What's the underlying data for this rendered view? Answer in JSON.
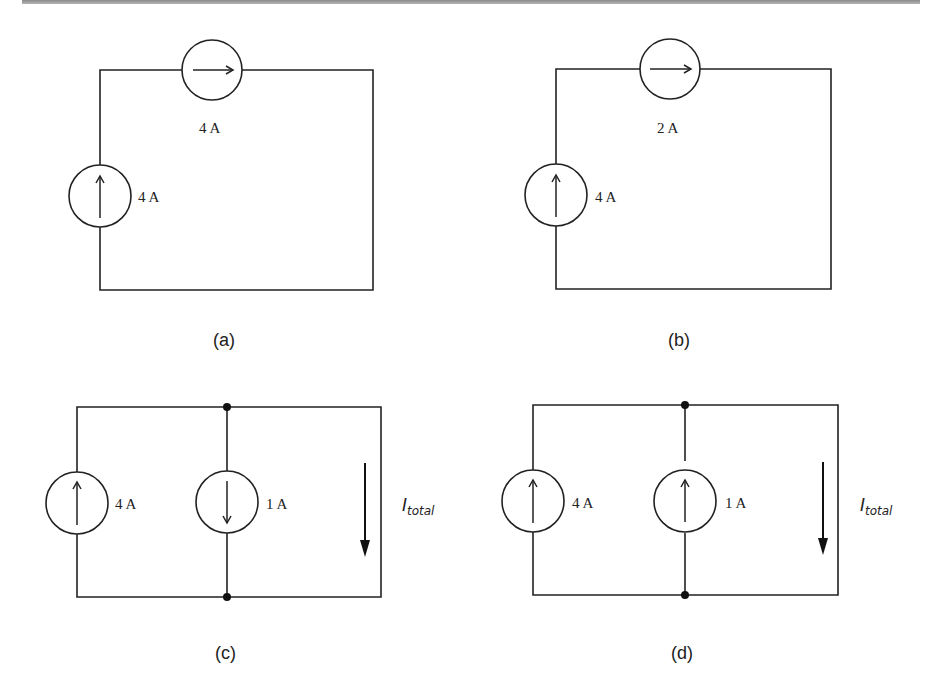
{
  "figure": {
    "header_rule_color": "#9a9a9a",
    "circuits": [
      {
        "id": "a",
        "caption": "(a)",
        "topology": "series loop",
        "sources": [
          {
            "position": "top",
            "direction": "right",
            "label": "4 A"
          },
          {
            "position": "left",
            "direction": "up",
            "label": "4 A"
          }
        ]
      },
      {
        "id": "b",
        "caption": "(b)",
        "topology": "series loop",
        "sources": [
          {
            "position": "top",
            "direction": "right",
            "label": "2 A"
          },
          {
            "position": "left",
            "direction": "up",
            "label": "4 A"
          }
        ]
      },
      {
        "id": "c",
        "caption": "(c)",
        "topology": "parallel",
        "sources": [
          {
            "position": "left",
            "direction": "up",
            "label": "4 A"
          },
          {
            "position": "middle",
            "direction": "down",
            "label": "1 A"
          }
        ],
        "current_label": {
          "main": "I",
          "sub": "total",
          "direction": "down"
        }
      },
      {
        "id": "d",
        "caption": "(d)",
        "topology": "parallel",
        "sources": [
          {
            "position": "left",
            "direction": "up",
            "label": "4 A"
          },
          {
            "position": "middle",
            "direction": "up",
            "label": "1 A"
          }
        ],
        "current_label": {
          "main": "I",
          "sub": "total",
          "direction": "down"
        }
      }
    ]
  }
}
